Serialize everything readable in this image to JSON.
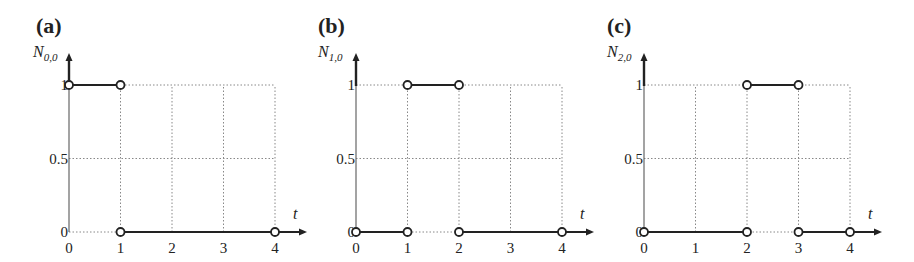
{
  "chart_data": [
    {
      "type": "line",
      "panel": "(a)",
      "title": "",
      "ylabel": "N",
      "ylabel_sub": "0,0",
      "xlabel": "t",
      "x_ticks": [
        "0",
        "1",
        "2",
        "3",
        "4"
      ],
      "y_ticks": [
        "0",
        "0.5",
        "1"
      ],
      "xlim": [
        0,
        4
      ],
      "ylim": [
        0,
        1
      ],
      "grid": true,
      "segments": [
        {
          "x": [
            0,
            1
          ],
          "y": [
            1,
            1
          ]
        },
        {
          "x": [
            1,
            4
          ],
          "y": [
            0,
            0
          ]
        }
      ],
      "open_points": [
        [
          0,
          1
        ],
        [
          1,
          1
        ],
        [
          1,
          0
        ],
        [
          4,
          0
        ]
      ],
      "x_tick_labels_text": {
        "t0": "0",
        "t1": "1",
        "t2": "2",
        "t3": "3",
        "t4": "4"
      }
    },
    {
      "type": "line",
      "panel": "(b)",
      "title": "",
      "ylabel": "N",
      "ylabel_sub": "1,0",
      "xlabel": "t",
      "x_ticks": [
        "0",
        "1",
        "2",
        "3",
        "4"
      ],
      "y_ticks": [
        "0",
        "0.5",
        "1"
      ],
      "xlim": [
        0,
        4
      ],
      "ylim": [
        0,
        1
      ],
      "grid": true,
      "segments": [
        {
          "x": [
            0,
            1
          ],
          "y": [
            0,
            0
          ]
        },
        {
          "x": [
            1,
            2
          ],
          "y": [
            1,
            1
          ]
        },
        {
          "x": [
            2,
            4
          ],
          "y": [
            0,
            0
          ]
        }
      ],
      "open_points": [
        [
          0,
          0
        ],
        [
          1,
          0
        ],
        [
          1,
          1
        ],
        [
          2,
          1
        ],
        [
          2,
          0
        ],
        [
          4,
          0
        ]
      ]
    },
    {
      "type": "line",
      "panel": "(c)",
      "title": "",
      "ylabel": "N",
      "ylabel_sub": "2,0",
      "xlabel": "t",
      "x_ticks": [
        "0",
        "1",
        "2",
        "3",
        "4"
      ],
      "y_ticks": [
        "0",
        "0.5",
        "1"
      ],
      "xlim": [
        0,
        4
      ],
      "ylim": [
        0,
        1
      ],
      "grid": true,
      "segments": [
        {
          "x": [
            0,
            2
          ],
          "y": [
            0,
            0
          ]
        },
        {
          "x": [
            2,
            3
          ],
          "y": [
            1,
            1
          ]
        },
        {
          "x": [
            3,
            4
          ],
          "y": [
            0,
            0
          ]
        }
      ],
      "open_points": [
        [
          0,
          0
        ],
        [
          2,
          0
        ],
        [
          2,
          1
        ],
        [
          3,
          1
        ],
        [
          3,
          0
        ],
        [
          4,
          0
        ]
      ]
    }
  ],
  "layout": {
    "panels": [
      {
        "origin_x": 69,
        "origin_y": 232,
        "unit_x": 51.5,
        "unit_y": 147,
        "label_x": 36,
        "label_y": 33,
        "ylab_x": 33,
        "ylab_y": 57
      },
      {
        "origin_x": 356,
        "origin_y": 232,
        "unit_x": 51.5,
        "unit_y": 147,
        "label_x": 318,
        "label_y": 33,
        "ylab_x": 318,
        "ylab_y": 57
      },
      {
        "origin_x": 644,
        "origin_y": 232,
        "unit_x": 51.5,
        "unit_y": 147,
        "label_x": 607,
        "label_y": 33,
        "ylab_x": 607,
        "ylab_y": 57
      }
    ]
  }
}
